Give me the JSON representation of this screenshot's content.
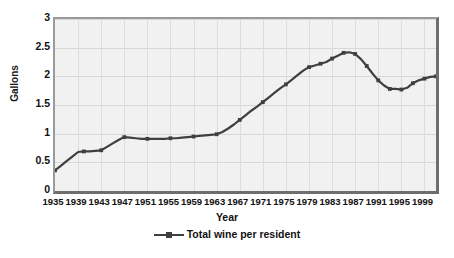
{
  "chart_data": {
    "type": "line",
    "title": "",
    "xlabel": "Year",
    "ylabel": "Gallons",
    "ylim": [
      0,
      3
    ],
    "yticks": [
      0,
      0.5,
      1,
      1.5,
      2,
      2.5,
      3
    ],
    "ytick_labels": [
      "0",
      "0.5",
      "1",
      "1.5",
      "2",
      "2.5",
      "3"
    ],
    "xlim": [
      1935,
      2001
    ],
    "xtick_labels": [
      "1935",
      "1939",
      "1943",
      "1947",
      "1951",
      "1955",
      "1959",
      "1963",
      "1967",
      "1971",
      "1975",
      "1979",
      "1983",
      "1987",
      "1991",
      "1995",
      "1999"
    ],
    "grid": true,
    "legend_position": "bottom",
    "series": [
      {
        "name": "Total wine per resident",
        "color": "#3f3f3f",
        "x": [
          1935,
          1936,
          1937,
          1938,
          1939,
          1940,
          1941,
          1942,
          1943,
          1944,
          1945,
          1946,
          1947,
          1948,
          1949,
          1950,
          1951,
          1952,
          1953,
          1954,
          1955,
          1956,
          1957,
          1958,
          1959,
          1960,
          1961,
          1962,
          1963,
          1964,
          1965,
          1966,
          1967,
          1968,
          1969,
          1970,
          1971,
          1972,
          1973,
          1974,
          1975,
          1976,
          1977,
          1978,
          1979,
          1980,
          1981,
          1982,
          1983,
          1984,
          1985,
          1986,
          1987,
          1988,
          1989,
          1990,
          1991,
          1992,
          1993,
          1994,
          1995,
          1996,
          1997,
          1998,
          1999,
          2000,
          2001
        ],
        "values": [
          0.36,
          0.44,
          0.52,
          0.6,
          0.68,
          0.69,
          0.69,
          0.7,
          0.71,
          0.77,
          0.83,
          0.89,
          0.94,
          0.93,
          0.92,
          0.91,
          0.91,
          0.91,
          0.91,
          0.91,
          0.92,
          0.92,
          0.93,
          0.94,
          0.95,
          0.96,
          0.97,
          0.98,
          0.99,
          1.03,
          1.09,
          1.16,
          1.24,
          1.32,
          1.4,
          1.47,
          1.55,
          1.63,
          1.71,
          1.79,
          1.86,
          1.94,
          2.02,
          2.1,
          2.16,
          2.19,
          2.22,
          2.25,
          2.31,
          2.36,
          2.41,
          2.42,
          2.39,
          2.3,
          2.18,
          2.05,
          1.93,
          1.84,
          1.78,
          1.78,
          1.77,
          1.8,
          1.88,
          1.93,
          1.96,
          1.99,
          2.0
        ]
      }
    ],
    "markers": [
      {
        "x": 1935,
        "y": 0.36
      },
      {
        "x": 1940,
        "y": 0.69
      },
      {
        "x": 1943,
        "y": 0.71
      },
      {
        "x": 1947,
        "y": 0.94
      },
      {
        "x": 1951,
        "y": 0.91
      },
      {
        "x": 1955,
        "y": 0.92
      },
      {
        "x": 1959,
        "y": 0.95
      },
      {
        "x": 1963,
        "y": 0.99
      },
      {
        "x": 1967,
        "y": 1.24
      },
      {
        "x": 1971,
        "y": 1.55
      },
      {
        "x": 1975,
        "y": 1.86
      },
      {
        "x": 1979,
        "y": 2.16
      },
      {
        "x": 1981,
        "y": 2.22
      },
      {
        "x": 1983,
        "y": 2.31
      },
      {
        "x": 1985,
        "y": 2.41
      },
      {
        "x": 1987,
        "y": 2.39
      },
      {
        "x": 1989,
        "y": 2.18
      },
      {
        "x": 1991,
        "y": 1.93
      },
      {
        "x": 1993,
        "y": 1.78
      },
      {
        "x": 1995,
        "y": 1.77
      },
      {
        "x": 1997,
        "y": 1.88
      },
      {
        "x": 1999,
        "y": 1.96
      },
      {
        "x": 2001,
        "y": 2.0
      }
    ]
  },
  "legend": {
    "items": [
      {
        "label": "Total wine per resident",
        "color": "#3f3f3f"
      }
    ]
  },
  "axes": {
    "x_title": "Year",
    "y_title": "Gallons"
  },
  "colors": {
    "plot_background": "#f1f1f1",
    "gridline": "#d7d7d7",
    "series_line": "#3f3f3f",
    "axis_border": "#6e6e6e",
    "text": "#111111"
  },
  "caption": ""
}
